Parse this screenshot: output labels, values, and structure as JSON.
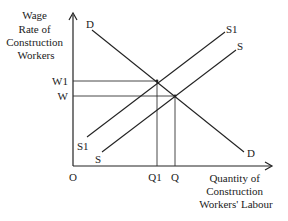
{
  "diagram": {
    "type": "supply-demand",
    "y_axis_label": [
      "Wage",
      "Rate of",
      "Construction",
      "Workers"
    ],
    "x_axis_label": [
      "Quantity of",
      "Construction",
      "Workers' Labour"
    ],
    "origin_label": "O",
    "curves": [
      {
        "name": "D",
        "kind": "demand",
        "label_start": "D",
        "label_end": "D"
      },
      {
        "name": "S1",
        "kind": "supply",
        "label_start": "S1",
        "label_end": "S1"
      },
      {
        "name": "S",
        "kind": "supply",
        "label_start": "S",
        "label_end": "S"
      }
    ],
    "price_levels": [
      {
        "label": "W1"
      },
      {
        "label": "W"
      }
    ],
    "quantity_levels": [
      {
        "label": "Q1"
      },
      {
        "label": "Q"
      }
    ],
    "equilibria": [
      {
        "curve_pair": [
          "D",
          "S1"
        ],
        "wage": "W1",
        "quantity": "Q1"
      },
      {
        "curve_pair": [
          "D",
          "S"
        ],
        "wage": "W",
        "quantity": "Q"
      }
    ],
    "colors": {
      "line": "#222222",
      "guide": "#333333",
      "background": "#ffffff"
    }
  }
}
